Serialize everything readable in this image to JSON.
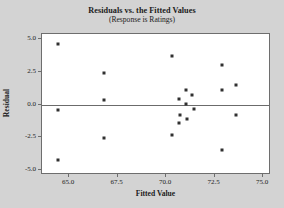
{
  "chart_data": {
    "type": "scatter",
    "title": "Residuals vs. the Fitted Values",
    "subtitle": "(Response is Ratings)",
    "xlabel": "Fitted Value",
    "ylabel": "Residual",
    "xlim": [
      63.6,
      75.4
    ],
    "ylim": [
      -5.4,
      5.4
    ],
    "xticks": [
      65.0,
      67.5,
      70.0,
      72.5,
      75.0
    ],
    "xtick_labels": [
      "65.0",
      "67.5",
      "70.0",
      "72.5",
      "75.0"
    ],
    "yticks": [
      5.0,
      2.5,
      0.0,
      -2.5,
      -5.0
    ],
    "ytick_labels": [
      "5.0",
      "2.5",
      "0.0",
      "-2.5",
      "-5.0"
    ],
    "grid": false,
    "legend": null,
    "reference_line_y": 0.0,
    "marker": "square",
    "marker_color": "#303030",
    "plot_background": "#ffffff",
    "figure_background": "#d3d3d3",
    "points": [
      {
        "x": 64.4,
        "y": 4.62
      },
      {
        "x": 64.4,
        "y": -0.42
      },
      {
        "x": 64.4,
        "y": -4.22
      },
      {
        "x": 66.8,
        "y": 2.38
      },
      {
        "x": 66.8,
        "y": 0.35
      },
      {
        "x": 66.8,
        "y": -2.58
      },
      {
        "x": 70.3,
        "y": 3.72
      },
      {
        "x": 70.3,
        "y": -2.35
      },
      {
        "x": 70.65,
        "y": 0.4
      },
      {
        "x": 70.7,
        "y": -0.78
      },
      {
        "x": 70.65,
        "y": -1.45
      },
      {
        "x": 71.0,
        "y": 1.12
      },
      {
        "x": 71.0,
        "y": 0.02
      },
      {
        "x": 71.05,
        "y": -1.1
      },
      {
        "x": 71.35,
        "y": 0.72
      },
      {
        "x": 71.45,
        "y": -0.35
      },
      {
        "x": 72.9,
        "y": 3.05
      },
      {
        "x": 72.9,
        "y": 1.1
      },
      {
        "x": 72.9,
        "y": -3.5
      },
      {
        "x": 73.6,
        "y": 1.48
      },
      {
        "x": 73.6,
        "y": -0.8
      }
    ]
  }
}
